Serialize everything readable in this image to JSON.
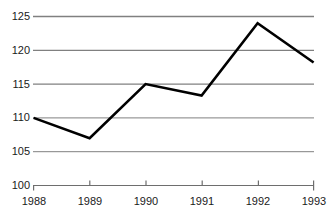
{
  "chart_data": {
    "type": "line",
    "title": "",
    "subtitle": "",
    "xlabel": "",
    "ylabel": "",
    "categories": [
      "1988",
      "1989",
      "1990",
      "1991",
      "1992",
      "1993"
    ],
    "x": [
      1988,
      1989,
      1990,
      1991,
      1992,
      1993
    ],
    "values": [
      110.0,
      107.0,
      115.0,
      113.3,
      124.0,
      118.2
    ],
    "series": [
      {
        "name": "",
        "values": [
          110.0,
          107.0,
          115.0,
          113.3,
          124.0,
          118.2
        ]
      }
    ],
    "ylim": [
      100,
      125
    ],
    "xlim": [
      "1988",
      "1993"
    ],
    "y_ticks": [
      100,
      105,
      110,
      115,
      120,
      125
    ],
    "y_tick_labels": [
      "100",
      "105",
      "110",
      "115",
      "120",
      "125"
    ],
    "x_ticks": [
      "1988",
      "1989",
      "1990",
      "1991",
      "1992",
      "1993"
    ],
    "grid": "horizontal",
    "legend": "none",
    "annotations": [],
    "colors": {
      "line": "#000000",
      "grid": "#808080",
      "axis": "#808080",
      "text": "#1a1a1a",
      "background": "#ffffff"
    }
  }
}
